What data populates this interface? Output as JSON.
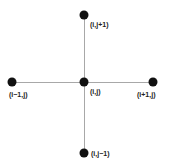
{
  "diagram": {
    "type": "five-point-stencil",
    "colors": {
      "node": "#111111",
      "edge": "#a8a8a8",
      "label": "#222222",
      "background": "#ffffff"
    },
    "nodes": {
      "top": {
        "label": "(i,j+1)",
        "x": 84,
        "y": 15
      },
      "left": {
        "label": "(i−1,j)",
        "x": 12,
        "y": 82
      },
      "center": {
        "label": "(i,j)",
        "x": 84,
        "y": 82
      },
      "right": {
        "label": "(i+1,j)",
        "x": 153,
        "y": 82
      },
      "bottom": {
        "label": "(i,j−1)",
        "x": 84,
        "y": 153
      }
    },
    "edges": [
      {
        "from": "left",
        "to": "right"
      },
      {
        "from": "top",
        "to": "bottom"
      }
    ]
  }
}
